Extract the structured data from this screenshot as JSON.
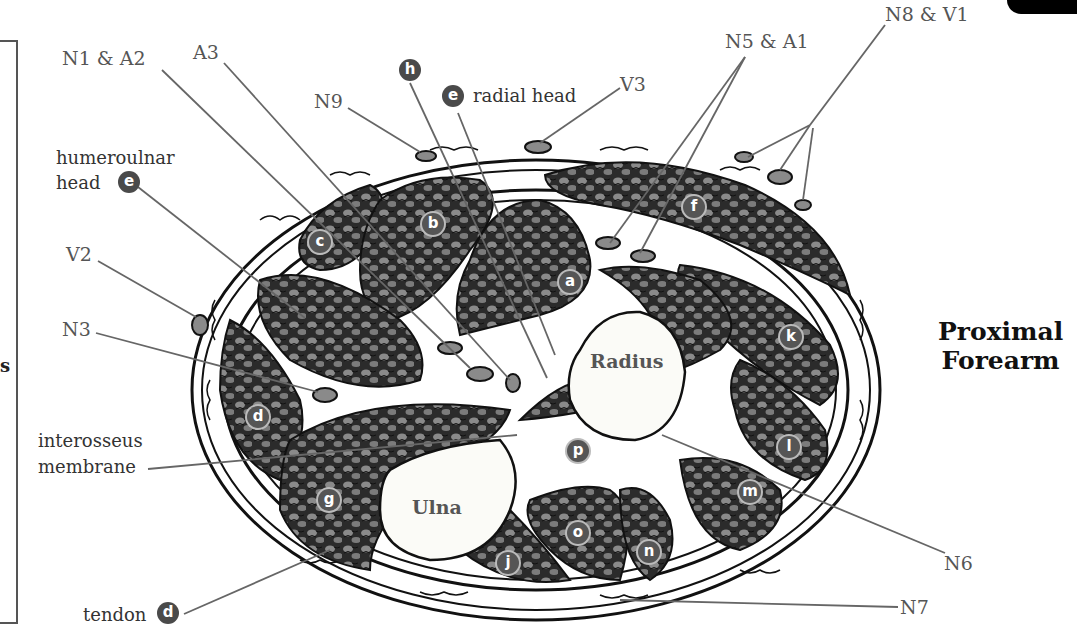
{
  "title": {
    "line1": "Proximal",
    "line2": "Forearm"
  },
  "frame_letter": "s",
  "bones": {
    "radius": "Radius",
    "ulna": "Ulna"
  },
  "vessel_nerve_labels": {
    "n1_a2": "N1 & A2",
    "a3": "A3",
    "n9": "N9",
    "v3": "V3",
    "n5_a1": "N5 & A1",
    "n8_v1": "N8 & V1",
    "v2": "V2",
    "n3": "N3",
    "n6": "N6",
    "n7": "N7"
  },
  "structure_labels": {
    "humeroulnar_head_line1": "humeroulnar",
    "humeroulnar_head_line2": "head",
    "radial_head": "radial head",
    "interosseus_line1": "interosseus",
    "interosseus_line2": "membrane",
    "tendon": "tendon"
  },
  "callout_badges": {
    "h": "h",
    "e_radial": "e",
    "e_humeroulnar": "e",
    "d_tendon": "d"
  },
  "muscle_badges": {
    "a": "a",
    "b": "b",
    "c": "c",
    "d": "d",
    "f": "f",
    "g": "g",
    "j": "j",
    "k": "k",
    "l": "l",
    "m": "m",
    "n": "n",
    "o": "o",
    "p": "p"
  },
  "colors": {
    "muscle_fill": "#2b2b2b",
    "muscle_highlight": "#8a8a8a",
    "bone_fill": "#fbfbf7",
    "label_text": "#555555",
    "badge_fill": "#4a4a4a",
    "leader_line": "#666666"
  }
}
